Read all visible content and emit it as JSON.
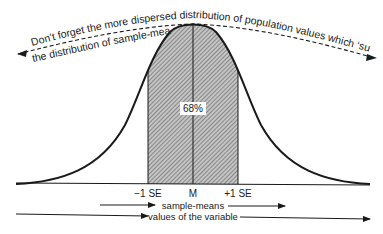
{
  "diagram": {
    "type": "normal-distribution",
    "annotation_top": "Don't forget the more dispersed distribution of population values which ‘surrounds’",
    "annotation_top_line1": "Don’t forget the more dispersed distribution of population values which ‘surrounds’",
    "annotation_top_line2": "the distribution of sample-means",
    "shaded_area_label": "68%",
    "axis_labels": {
      "minus_one_se": "−1 SE",
      "mean": "M",
      "plus_one_se": "+1 SE"
    },
    "arrow_labels": {
      "sample_means": "sample-means",
      "values_of_variable": "values of the variable"
    },
    "colors": {
      "ink": "#1a1a1a",
      "shade": "#9a9a9a",
      "background": "#ffffff"
    }
  }
}
